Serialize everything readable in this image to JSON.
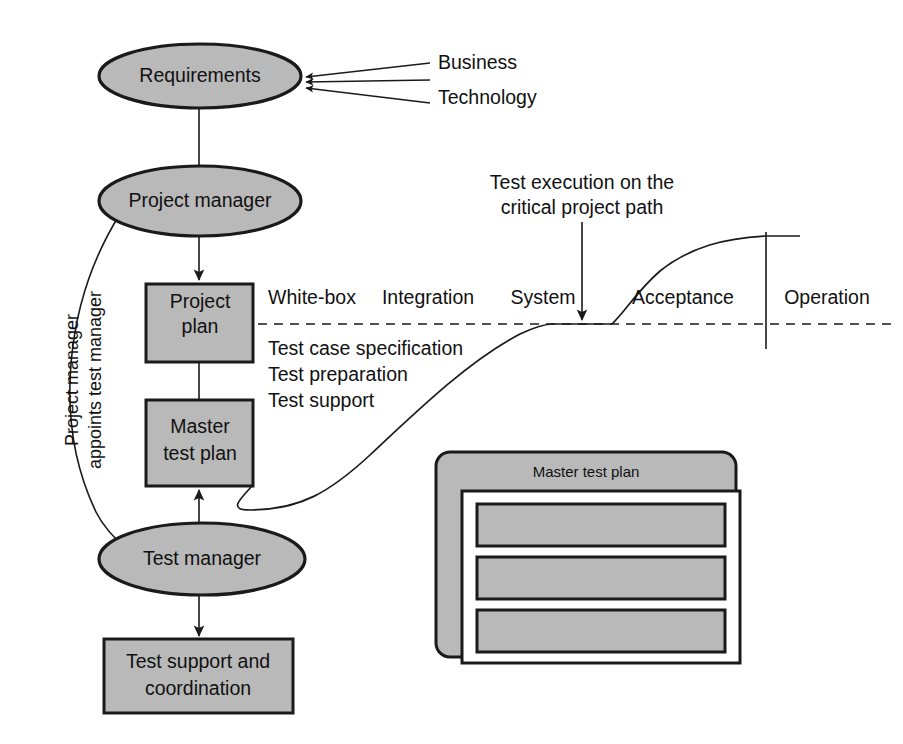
{
  "diagram": {
    "colors": {
      "node_fill": "#b9b9b9",
      "stroke": "#1a1a1a",
      "background": "#ffffff",
      "text": "#111111"
    },
    "nodes": {
      "requirements": "Requirements",
      "project_manager": "Project manager",
      "project_plan_line1": "Project",
      "project_plan_line2": "plan",
      "master_test_plan_line1": "Master",
      "master_test_plan_line2": "test plan",
      "test_manager": "Test manager",
      "test_support_line1": "Test support and",
      "test_support_line2": "coordination"
    },
    "inputs": {
      "business": "Business",
      "technology": "Technology"
    },
    "edge_labels": {
      "appoints_line1": "Project manager",
      "appoints_line2": "appoints test manager"
    },
    "timeline": {
      "phases": [
        "White-box",
        "Integration",
        "System",
        "Acceptance",
        "Operation"
      ]
    },
    "callout": {
      "line1": "Test execution on the",
      "line2": "critical project path"
    },
    "activities": [
      "Test case specification",
      "Test preparation",
      "Test support"
    ],
    "panel": {
      "title": "Master test plan",
      "bar_count": 3
    }
  }
}
